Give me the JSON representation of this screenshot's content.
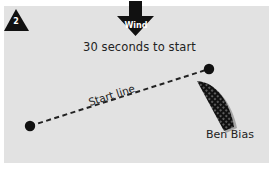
{
  "diagram": {
    "step": {
      "number": "2"
    },
    "wind": {
      "label": "Wind",
      "direction": "down"
    },
    "timer_text": "30 seconds to start",
    "start_line": {
      "label": "Start line"
    },
    "boat": {
      "name": "Ben Bias"
    },
    "colors": {
      "background": "#e2e2e2",
      "frame": "#ffffff",
      "ink": "#111111",
      "text": "#222222"
    }
  }
}
